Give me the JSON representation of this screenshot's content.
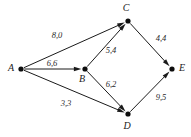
{
  "diagram": {
    "type": "directed-graph",
    "title": "",
    "background_color": "#ffffff",
    "line_color": "#1a1a1a",
    "nodes": [
      {
        "id": "A",
        "label": "A",
        "x": 21,
        "y": 69,
        "label_x": 11,
        "label_y": 69
      },
      {
        "id": "B",
        "label": "B",
        "x": 85,
        "y": 69,
        "label_x": 82,
        "label_y": 80
      },
      {
        "id": "C",
        "label": "C",
        "x": 128,
        "y": 21,
        "label_x": 126,
        "label_y": 9
      },
      {
        "id": "D",
        "label": "D",
        "x": 128,
        "y": 114,
        "label_x": 127,
        "label_y": 127
      },
      {
        "id": "E",
        "label": "E",
        "x": 172,
        "y": 69,
        "label_x": 182,
        "label_y": 69
      }
    ],
    "edges": [
      {
        "id": "A-C",
        "from": "A",
        "to": "C",
        "label": "8,0",
        "label_x": 57,
        "label_y": 36
      },
      {
        "id": "A-B",
        "from": "A",
        "to": "B",
        "label": "6,6",
        "label_x": 52,
        "label_y": 64
      },
      {
        "id": "A-D",
        "from": "A",
        "to": "D",
        "label": "3,3",
        "label_x": 66,
        "label_y": 104
      },
      {
        "id": "B-C",
        "from": "B",
        "to": "C",
        "label": "5,4",
        "label_x": 111,
        "label_y": 51
      },
      {
        "id": "B-D",
        "from": "B",
        "to": "D",
        "label": "6,2",
        "label_x": 111,
        "label_y": 85
      },
      {
        "id": "C-E",
        "from": "C",
        "to": "E",
        "label": "4,4",
        "label_x": 161,
        "label_y": 39
      },
      {
        "id": "D-E",
        "from": "D",
        "to": "E",
        "label": "9,5",
        "label_x": 161,
        "label_y": 98
      }
    ]
  }
}
